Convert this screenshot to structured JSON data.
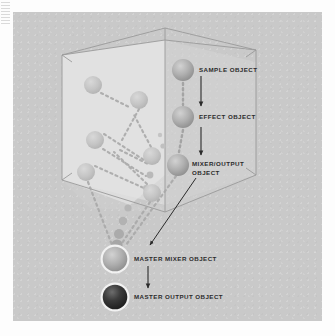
{
  "figure": {
    "background_color": "#fdfdfd",
    "panel_color": "#c9c9c9",
    "ink_color": "#2b2b2b"
  },
  "labels": {
    "sample_object": "SAMPLE OBJECT",
    "effect_object": "EFFECT OBJECT",
    "mixer_output_object_line1": "MIXER/OUTPUT",
    "mixer_output_object_line2": "OBJECT",
    "master_mixer_object": "MASTER MIXER OBJECT",
    "master_output_object": "MASTER OUTPUT OBJECT"
  },
  "nodes": [
    {
      "name": "sample-object-node",
      "cx": 183,
      "cy": 70,
      "r": 11,
      "fill": "#9f9f9f",
      "ring": false
    },
    {
      "name": "effect-object-node",
      "cx": 183,
      "cy": 117,
      "r": 11,
      "fill": "#9d9d9d",
      "ring": false
    },
    {
      "name": "mixer-output-object-node",
      "cx": 178,
      "cy": 165,
      "r": 11,
      "fill": "#a2a2a2",
      "ring": false
    },
    {
      "name": "master-mixer-object-node",
      "cx": 115,
      "cy": 259,
      "r": 13,
      "fill": "#aaaaaa",
      "ring": true
    },
    {
      "name": "master-output-object-node",
      "cx": 115,
      "cy": 297,
      "r": 13,
      "fill": "#3a3a3a",
      "ring": true
    },
    {
      "name": "interior-node-1",
      "cx": 93,
      "cy": 85,
      "r": 9,
      "fill": "#bcbcbc",
      "ring": false
    },
    {
      "name": "interior-node-2",
      "cx": 139,
      "cy": 100,
      "r": 9,
      "fill": "#bdbdbd",
      "ring": false
    },
    {
      "name": "interior-node-3",
      "cx": 95,
      "cy": 140,
      "r": 9,
      "fill": "#bcbcbc",
      "ring": false
    },
    {
      "name": "interior-node-4",
      "cx": 152,
      "cy": 156,
      "r": 9,
      "fill": "#bebebe",
      "ring": false
    },
    {
      "name": "interior-node-5",
      "cx": 86,
      "cy": 172,
      "r": 9,
      "fill": "#bababa",
      "ring": false
    },
    {
      "name": "interior-node-6",
      "cx": 152,
      "cy": 193,
      "r": 9,
      "fill": "#bcbcbc",
      "ring": false
    }
  ],
  "callouts": [
    {
      "name": "sample-to-effect-arrow",
      "from_label": "SAMPLE OBJECT",
      "to_label": "EFFECT OBJECT"
    },
    {
      "name": "effect-to-mixer-arrow",
      "from_label": "EFFECT OBJECT",
      "to_label": "MIXER/OUTPUT OBJECT"
    },
    {
      "name": "mixer-to-master-pointer",
      "from_label": "MIXER/OUTPUT OBJECT",
      "to_label": "MASTER MIXER OBJECT"
    },
    {
      "name": "master-mixer-to-output-arrow",
      "from_label": "MASTER MIXER OBJECT",
      "to_label": "MASTER OUTPUT OBJECT"
    }
  ]
}
